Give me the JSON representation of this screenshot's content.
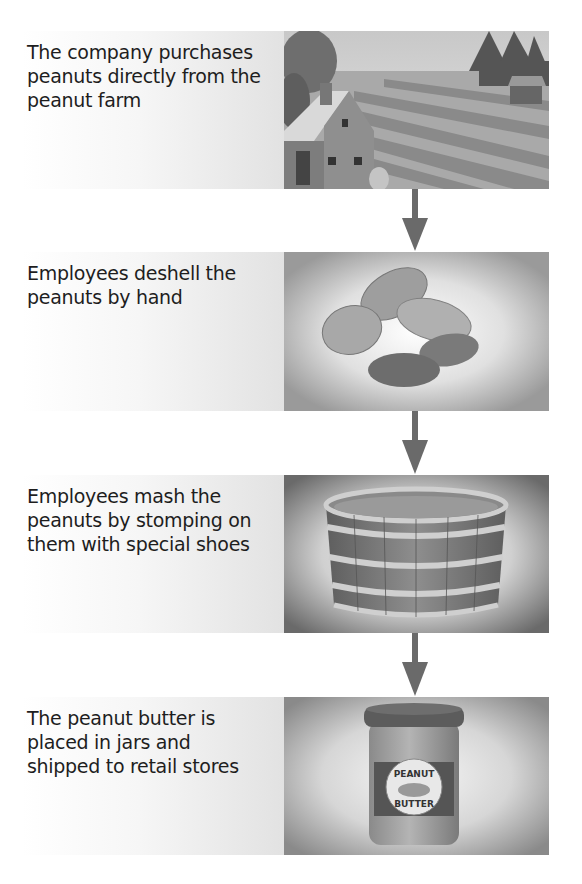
{
  "diagram": {
    "type": "process-flow",
    "direction": "top-to-bottom",
    "steps": [
      {
        "index": 1,
        "text": "The company purchases peanuts directly from the peanut farm",
        "lines": [
          "The company purchases",
          "peanuts directly from the",
          "peanut farm"
        ],
        "illustration": "farm-icon"
      },
      {
        "index": 2,
        "text": "Employees deshell the peanuts by hand",
        "lines": [
          "Employees deshell the",
          "peanuts by hand"
        ],
        "illustration": "peanuts-icon"
      },
      {
        "index": 3,
        "text": "Employees mash the peanuts by stomping on them with special shoes",
        "lines": [
          "Employees mash the",
          "peanuts by stomping on",
          "them with special shoes"
        ],
        "illustration": "barrel-icon"
      },
      {
        "index": 4,
        "text": "The peanut butter is placed in jars and shipped to retail stores",
        "lines": [
          "The peanut butter is",
          "placed in jars and",
          "shipped to retail stores"
        ],
        "illustration": "peanut-butter-jar-icon"
      }
    ],
    "jar_label": {
      "top": "PEANUT",
      "bottom": "BUTTER"
    },
    "connectors": [
      {
        "from": 1,
        "to": 2,
        "icon": "arrow-down-icon"
      },
      {
        "from": 2,
        "to": 3,
        "icon": "arrow-down-icon"
      },
      {
        "from": 3,
        "to": 4,
        "icon": "arrow-down-icon"
      }
    ],
    "colors": {
      "arrow": "#6a6a6a",
      "text": "#1e1e1e",
      "panel_gray": "#9a9a9a"
    }
  }
}
